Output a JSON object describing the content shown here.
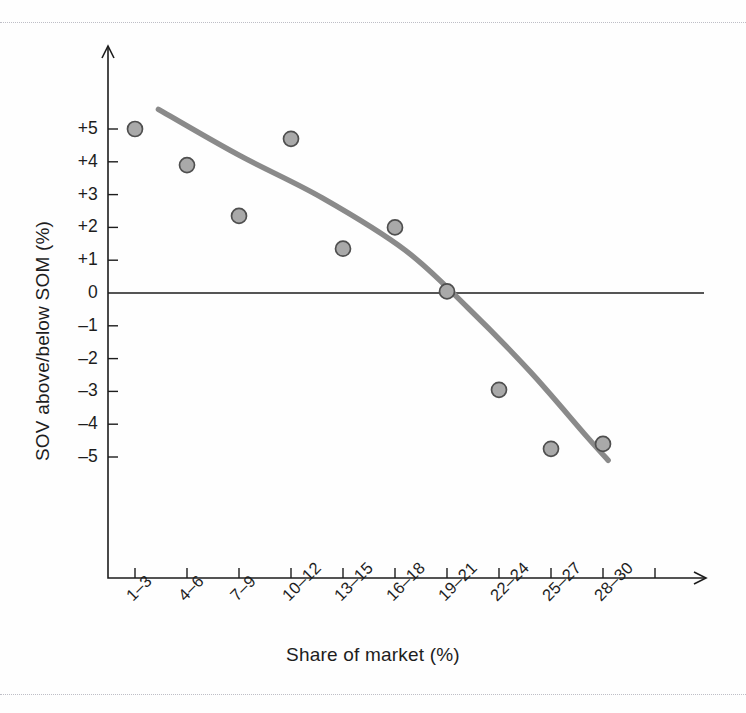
{
  "chart_data": {
    "type": "scatter",
    "title": "",
    "subtitle": "",
    "xlabel": "Share of market (%)",
    "ylabel": "SOV above/below SOM (%)",
    "categories": [
      "1–3",
      "4–6",
      "7–9",
      "10–12",
      "13–15",
      "16–18",
      "19–21",
      "22–24",
      "25–27",
      "28–30"
    ],
    "x_tick_labels": [
      "1–3",
      "4–6",
      "7–9",
      "10–12",
      "13–15",
      "16–18",
      "19–21",
      "22–24",
      "25–27",
      "28–30"
    ],
    "y_tick_labels": [
      "+5",
      "+4",
      "+3",
      "+2",
      "+1",
      "0",
      "–1",
      "–2",
      "–3",
      "–4",
      "–5"
    ],
    "y_tick_values": [
      5,
      4,
      3,
      2,
      1,
      0,
      -1,
      -2,
      -3,
      -4,
      -5
    ],
    "ylim": [
      -5,
      5
    ],
    "grid": false,
    "legend": false,
    "zero_line": true,
    "points": [
      {
        "category": "1–3",
        "x": 1,
        "y": 5.0
      },
      {
        "category": "4–6",
        "x": 2,
        "y": 3.9
      },
      {
        "category": "7–9",
        "x": 3,
        "y": 2.35
      },
      {
        "category": "10–12",
        "x": 4,
        "y": 4.7
      },
      {
        "category": "13–15",
        "x": 5,
        "y": 1.35
      },
      {
        "category": "16–18",
        "x": 6,
        "y": 2.0
      },
      {
        "category": "19–21",
        "x": 7,
        "y": 0.05
      },
      {
        "category": "22–24",
        "x": 8,
        "y": -2.95
      },
      {
        "category": "25–27",
        "x": 9,
        "y": -4.75
      },
      {
        "category": "28–30",
        "x": 10,
        "y": -4.6
      }
    ],
    "trend": {
      "name": "fitted trend",
      "style": "smooth-curve",
      "color": "#8a8a8a",
      "points": [
        {
          "x": 1.45,
          "y": 5.6
        },
        {
          "x": 3.0,
          "y": 4.2
        },
        {
          "x": 4.6,
          "y": 2.9
        },
        {
          "x": 6.2,
          "y": 1.3
        },
        {
          "x": 7.4,
          "y": -0.45
        },
        {
          "x": 8.6,
          "y": -2.4
        },
        {
          "x": 9.7,
          "y": -4.4
        },
        {
          "x": 10.1,
          "y": -5.1
        }
      ]
    },
    "marker": {
      "shape": "circle",
      "fill": "#a9a9a9",
      "edge": "#4f4f4f",
      "size_px": 15
    },
    "colors": {
      "axis": "#1d1d1d",
      "trend": "#8a8a8a",
      "marker_fill": "#a9a9a9",
      "marker_edge": "#4f4f4f",
      "background": "#fefefe",
      "scan_rule": "#b4b4bd"
    }
  }
}
